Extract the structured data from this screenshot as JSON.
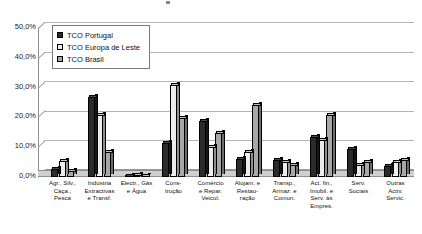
{
  "chart": {
    "axis_tick_marks": 6,
    "yaxis_label": "",
    "xaxis_label": ""
  },
  "legend": {
    "items": [
      {
        "label": "TCO Portugal",
        "color": "#2b2b2b"
      },
      {
        "label": "TCO Europa de Leste",
        "color": "#ededed"
      },
      {
        "label": "TCO Brasil",
        "color": "#a8a8a8"
      }
    ]
  },
  "chart_data": {
    "type": "bar",
    "title": "",
    "subtitle": "",
    "xlabel": "",
    "ylabel": "",
    "ylim": [
      0,
      50
    ],
    "ytick_labels": [
      "50,0%",
      "40,0%",
      "30,0%",
      "20,0%",
      "10,0%",
      "0,0%"
    ],
    "ytick_values": [
      50,
      40,
      30,
      20,
      10,
      0
    ],
    "grid": true,
    "legend_position": "top-left-inside",
    "categories": [
      "Agr., Silv., Caça., Pesca",
      "Indústria Extractivas e Transf.",
      "Electr., Gás e Água",
      "Construção",
      "Comércio e Repar. Veicul.",
      "Alojam. e Restauração",
      "Transp., Armaz. e Comun.",
      "Act. fin., Imobil. e Serv. às Empres.",
      "Serv. Sociais",
      "Outras Activ. Servic."
    ],
    "category_lines": [
      [
        "Agr., Silv.,",
        "Caça.,",
        "Pesca"
      ],
      [
        "Indústria",
        "Extractivas",
        "e Transf."
      ],
      [
        "Electr., Gás",
        "e Água"
      ],
      [
        "Cons-",
        "trução"
      ],
      [
        "Comércio",
        "e Repar.",
        "Veicul."
      ],
      [
        "Alojam. e",
        "Restau-",
        "ração"
      ],
      [
        "Transp.,",
        "Armaz. e",
        "Comun."
      ],
      [
        "Act. fin.,",
        "Imobil. e",
        "Serv. às",
        "Empres."
      ],
      [
        "Serv.",
        "Sociais"
      ],
      [
        "Outras",
        "Activ.",
        "Servic."
      ]
    ],
    "series": [
      {
        "name": "TCO Portugal",
        "color": "#2b2b2b",
        "values": [
          2.6,
          27.2,
          0.4,
          11.5,
          19.0,
          6.0,
          5.6,
          13.6,
          9.6,
          3.6
        ]
      },
      {
        "name": "TCO Europa de Leste",
        "color": "#ededed",
        "values": [
          5.4,
          21.0,
          0.6,
          31.0,
          10.2,
          8.6,
          5.0,
          12.6,
          4.0,
          5.0
        ]
      },
      {
        "name": "TCO Brasil",
        "color": "#a8a8a8",
        "values": [
          2.0,
          8.6,
          0.3,
          20.0,
          14.8,
          24.2,
          4.0,
          21.0,
          5.2,
          5.6
        ]
      }
    ]
  }
}
